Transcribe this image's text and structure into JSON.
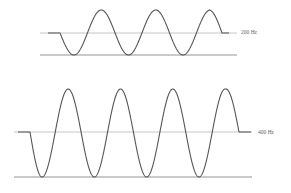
{
  "waveforms": [
    {
      "label": "200 Hz",
      "frequency_hz": 200,
      "midline_y": 33,
      "baseline_y": 55,
      "peak_y": 10,
      "lines_x": [
        40,
        237
      ],
      "lead_flat": [
        48,
        60
      ],
      "troughs_x": [
        74,
        126,
        180
      ],
      "peaks_x": [
        100,
        153,
        209
      ],
      "end_x": 222,
      "tail_flat_end": 229,
      "label_pos": [
        241,
        30
      ]
    },
    {
      "label": "400 Hz",
      "frequency_hz": 400,
      "midline_y": 132,
      "baseline_y": 177,
      "peak_y": 89,
      "lines_x": [
        14,
        252
      ],
      "lead_flat": [
        18,
        30
      ],
      "troughs_x": [
        42,
        94,
        146,
        199
      ],
      "peaks_x": [
        69,
        121,
        173,
        226
      ],
      "end_x": 239,
      "tail_flat_end": 251,
      "label_pos": [
        258,
        130
      ]
    }
  ],
  "colors": {
    "wave": "#555555",
    "midline": "#b8b8b8",
    "baseline": "#888888",
    "label": "#666666"
  }
}
